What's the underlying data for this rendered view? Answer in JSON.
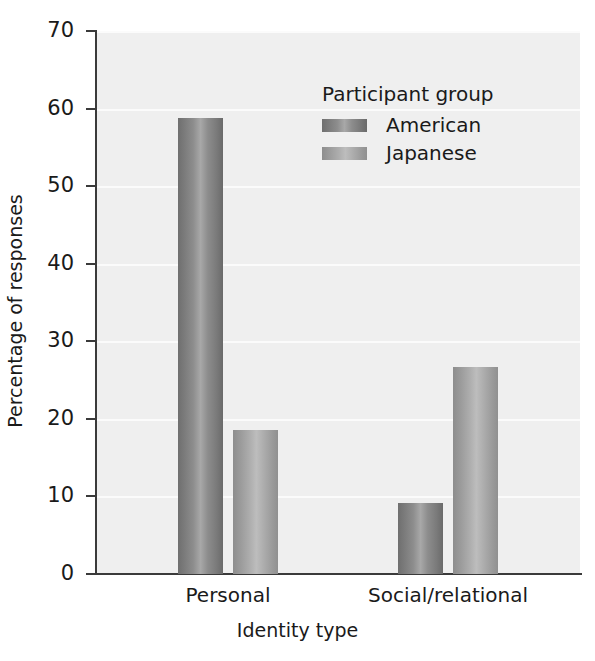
{
  "chart_data": {
    "type": "bar",
    "title": "",
    "xlabel": "Identity type",
    "ylabel": "Percentage of responses",
    "categories": [
      "Personal",
      "Social/relational"
    ],
    "series": [
      {
        "name": "American",
        "values": [
          58.8,
          9.1
        ],
        "color": "#8d8d8d"
      },
      {
        "name": "Japanese",
        "values": [
          18.5,
          26.7
        ],
        "color": "#aeaeae"
      }
    ],
    "ylim": [
      0,
      70
    ],
    "yticks": [
      0,
      10,
      20,
      30,
      40,
      50,
      60,
      70
    ],
    "ytick_labels": [
      "0",
      "10",
      "20",
      "30",
      "40",
      "50",
      "60",
      "70"
    ],
    "grid": "horizontal",
    "gridline_color": "#fbfbfb",
    "plot_background": "#efefef",
    "axis_color": "#3a3a3a",
    "legend": {
      "title": "Participant group",
      "position": "upper-center-right",
      "entries": [
        "American",
        "Japanese"
      ]
    }
  }
}
